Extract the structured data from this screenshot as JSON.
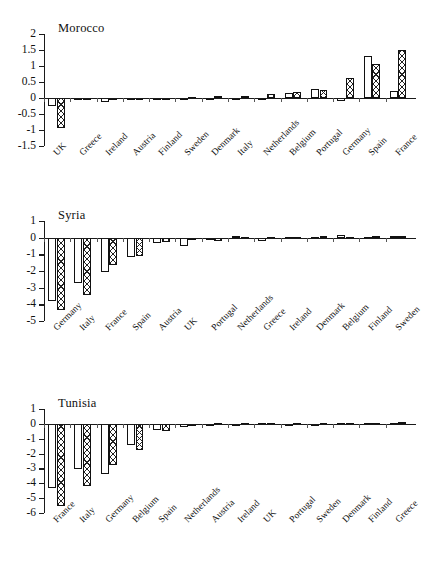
{
  "figure": {
    "kind": "three-panel-bar-chart",
    "background": "#ffffff",
    "ink_color": "#111111"
  },
  "panels": [
    {
      "id": "morocco",
      "title": "Morocco",
      "yticks": [
        "2",
        "1.5",
        "1",
        "0.5",
        "0",
        "-0.5",
        "-1",
        "-1.5"
      ],
      "categories": [
        "UK",
        "Greece",
        "Ireland",
        "Austria",
        "Finland",
        "Sweden",
        "Denmark",
        "Italy",
        "Netherlands",
        "Belgium",
        "Portugal",
        "Germany",
        "Spain",
        "France"
      ]
    },
    {
      "id": "syria",
      "title": "Syria",
      "yticks": [
        "1",
        "0",
        "-1",
        "-2",
        "-3",
        "-4",
        "-5"
      ],
      "categories": [
        "Germany",
        "Italy",
        "France",
        "Spain",
        "Austria",
        "UK",
        "Portugal",
        "Netherlands",
        "Greece",
        "Ireland",
        "Denmark",
        "Belgium",
        "Finland",
        "Sweden"
      ]
    },
    {
      "id": "tunisia",
      "title": "Tunisia",
      "yticks": [
        "1",
        "0",
        "-1",
        "-2",
        "-3",
        "-4",
        "-5",
        "-6"
      ],
      "categories": [
        "France",
        "Italy",
        "Germany",
        "Belgium",
        "Spain",
        "Netherlands",
        "Austria",
        "Ireland",
        "UK",
        "Portugal",
        "Sweden",
        "Denmark",
        "Finland",
        "Greece"
      ]
    }
  ],
  "chart_data": [
    {
      "type": "bar",
      "title": "Morocco",
      "xlabel": "",
      "ylabel": "",
      "ylim": [
        -1.5,
        2
      ],
      "yticks": [
        2,
        1.5,
        1,
        0.5,
        0,
        -0.5,
        -1,
        -1.5
      ],
      "grid": false,
      "legend": "none",
      "categories": [
        "UK",
        "Greece",
        "Ireland",
        "Austria",
        "Finland",
        "Sweden",
        "Denmark",
        "Italy",
        "Netherlands",
        "Belgium",
        "Portugal",
        "Germany",
        "Spain",
        "France"
      ],
      "series": [
        {
          "name": "series-1-open",
          "pattern": "open",
          "values": [
            -0.25,
            -0.04,
            -0.12,
            -0.03,
            -0.03,
            -0.04,
            -0.02,
            0.01,
            -0.05,
            0.15,
            0.27,
            -0.08,
            1.32,
            0.21
          ]
        },
        {
          "name": "series-2-hatched",
          "pattern": "cross-hatch",
          "values": [
            -0.95,
            -0.06,
            -0.04,
            -0.04,
            -0.05,
            0.04,
            0.05,
            0.05,
            0.11,
            0.18,
            0.25,
            0.63,
            1.05,
            1.5
          ]
        }
      ]
    },
    {
      "type": "bar",
      "title": "Syria",
      "xlabel": "",
      "ylabel": "",
      "ylim": [
        -5,
        1
      ],
      "yticks": [
        1,
        0,
        -1,
        -2,
        -3,
        -4,
        -5
      ],
      "grid": false,
      "legend": "none",
      "categories": [
        "Germany",
        "Italy",
        "France",
        "Spain",
        "Austria",
        "UK",
        "Portugal",
        "Netherlands",
        "Greece",
        "Ireland",
        "Denmark",
        "Belgium",
        "Finland",
        "Sweden"
      ],
      "series": [
        {
          "name": "series-1-open",
          "pattern": "open",
          "values": [
            -3.8,
            -2.75,
            -2.05,
            -1.15,
            -0.3,
            -0.5,
            -0.1,
            0.12,
            -0.18,
            0.02,
            0.05,
            0.14,
            0.06,
            0.08
          ]
        },
        {
          "name": "series-2-hatched",
          "pattern": "cross-hatch",
          "values": [
            -4.35,
            -3.45,
            -1.65,
            -1.1,
            -0.25,
            -0.15,
            -0.18,
            0.05,
            0.03,
            0.05,
            0.08,
            0.07,
            0.1,
            0.12
          ]
        }
      ]
    },
    {
      "type": "bar",
      "title": "Tunisia",
      "xlabel": "",
      "ylabel": "",
      "ylim": [
        -6,
        1
      ],
      "yticks": [
        1,
        0,
        -1,
        -2,
        -3,
        -4,
        -5,
        -6
      ],
      "grid": false,
      "legend": "none",
      "categories": [
        "France",
        "Italy",
        "Germany",
        "Belgium",
        "Spain",
        "Netherlands",
        "Austria",
        "Ireland",
        "UK",
        "Portugal",
        "Sweden",
        "Denmark",
        "Finland",
        "Greece"
      ],
      "series": [
        {
          "name": "series-1-open",
          "pattern": "open",
          "values": [
            -4.35,
            -3.05,
            -3.4,
            -1.4,
            -0.4,
            -0.18,
            -0.04,
            0.02,
            0.07,
            0.02,
            0.01,
            0.05,
            0.06,
            0.05
          ]
        },
        {
          "name": "series-2-hatched",
          "pattern": "cross-hatch",
          "values": [
            -5.5,
            -4.15,
            -2.75,
            -1.75,
            -0.5,
            -0.15,
            0.03,
            0.03,
            0.04,
            0.03,
            0.04,
            0.06,
            0.08,
            0.15
          ]
        }
      ]
    }
  ]
}
